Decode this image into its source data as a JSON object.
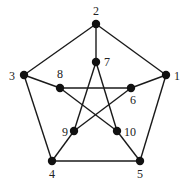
{
  "diagram": {
    "colors": {
      "node": "#111111",
      "edge": "#1a1a1a",
      "label": "#222222",
      "background": "#ffffff"
    },
    "nodes": [
      {
        "id": "1",
        "label": "1",
        "x": 166,
        "y": 75,
        "lx": 174,
        "ly": 80,
        "anchor": "start"
      },
      {
        "id": "2",
        "label": "2",
        "x": 96,
        "y": 24,
        "lx": 96,
        "ly": 15,
        "anchor": "middle"
      },
      {
        "id": "3",
        "label": "3",
        "x": 24,
        "y": 75,
        "lx": 15,
        "ly": 80,
        "anchor": "end"
      },
      {
        "id": "4",
        "label": "4",
        "x": 52,
        "y": 161,
        "lx": 52,
        "ly": 178,
        "anchor": "middle"
      },
      {
        "id": "5",
        "label": "5",
        "x": 140,
        "y": 161,
        "lx": 140,
        "ly": 178,
        "anchor": "middle"
      },
      {
        "id": "6",
        "label": "6",
        "x": 131,
        "y": 88,
        "lx": 133,
        "ly": 104,
        "anchor": "middle"
      },
      {
        "id": "7",
        "label": "7",
        "x": 96,
        "y": 62,
        "lx": 104,
        "ly": 66,
        "anchor": "start"
      },
      {
        "id": "8",
        "label": "8",
        "x": 60,
        "y": 88,
        "lx": 60,
        "ly": 78,
        "anchor": "middle"
      },
      {
        "id": "9",
        "label": "9",
        "x": 74,
        "y": 131,
        "lx": 68,
        "ly": 136,
        "anchor": "end"
      },
      {
        "id": "10",
        "label": "10",
        "x": 117,
        "y": 131,
        "lx": 124,
        "ly": 136,
        "anchor": "start"
      }
    ],
    "edges": [
      [
        "2",
        "1"
      ],
      [
        "1",
        "5"
      ],
      [
        "5",
        "4"
      ],
      [
        "4",
        "3"
      ],
      [
        "3",
        "2"
      ],
      [
        "2",
        "7"
      ],
      [
        "1",
        "6"
      ],
      [
        "5",
        "10"
      ],
      [
        "4",
        "9"
      ],
      [
        "3",
        "8"
      ],
      [
        "7",
        "9"
      ],
      [
        "7",
        "10"
      ],
      [
        "8",
        "6"
      ],
      [
        "8",
        "10"
      ],
      [
        "6",
        "9"
      ]
    ]
  }
}
